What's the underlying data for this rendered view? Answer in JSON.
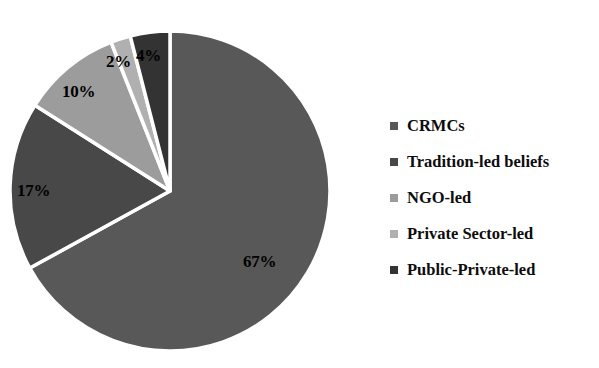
{
  "chart_data": {
    "type": "pie",
    "title": "",
    "labels": [
      "CRMCs",
      "Tradition-led beliefs",
      "NGO-led",
      "Private Sector-led",
      "Public-Private-led"
    ],
    "values": [
      67,
      17,
      10,
      2,
      4
    ],
    "value_labels": [
      "67%",
      "17%",
      "10%",
      "2%",
      "4%"
    ],
    "colors": [
      "#585858",
      "#484848",
      "#9c9c9c",
      "#b0b0b0",
      "#333333"
    ],
    "units": "percent",
    "start_angle_deg": 0,
    "direction": "clockwise",
    "separator_color": "#ffffff",
    "legend_position": "right",
    "grid": false,
    "xlabel": "",
    "ylabel": ""
  },
  "legend": {
    "items": [
      {
        "label": "CRMCs",
        "color": "#585858"
      },
      {
        "label": "Tradition-led beliefs",
        "color": "#484848"
      },
      {
        "label": "NGO-led",
        "color": "#9c9c9c"
      },
      {
        "label": "Private Sector-led",
        "color": "#b0b0b0"
      },
      {
        "label": "Public-Private-led",
        "color": "#333333"
      }
    ]
  },
  "pie_labels": {
    "crmcs": "67%",
    "tradition": "17%",
    "ngo": "10%",
    "private_sector": "2%",
    "public_private": "4%"
  }
}
